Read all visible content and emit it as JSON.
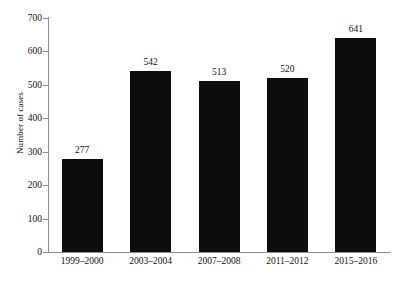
{
  "chart_data": {
    "type": "bar",
    "title": "",
    "xlabel": "",
    "ylabel": "Number of cases",
    "categories": [
      "1999–2000",
      "2003–2004",
      "2007–2008",
      "2011–2012",
      "2015–2016"
    ],
    "values": [
      277,
      542,
      513,
      520,
      641
    ],
    "value_labels": [
      "277",
      "542",
      "513",
      "520",
      "641"
    ],
    "ylim": [
      0,
      700
    ],
    "ytick_values": [
      0,
      100,
      200,
      300,
      400,
      500,
      600,
      700
    ],
    "ytick_labels": [
      "0",
      "100",
      "200",
      "300",
      "400",
      "500",
      "600",
      "700"
    ],
    "grid": false,
    "legend": null,
    "bar_color": "#0d0d0d",
    "axis_color": "#8d8d8d",
    "background": "#ffffff"
  }
}
